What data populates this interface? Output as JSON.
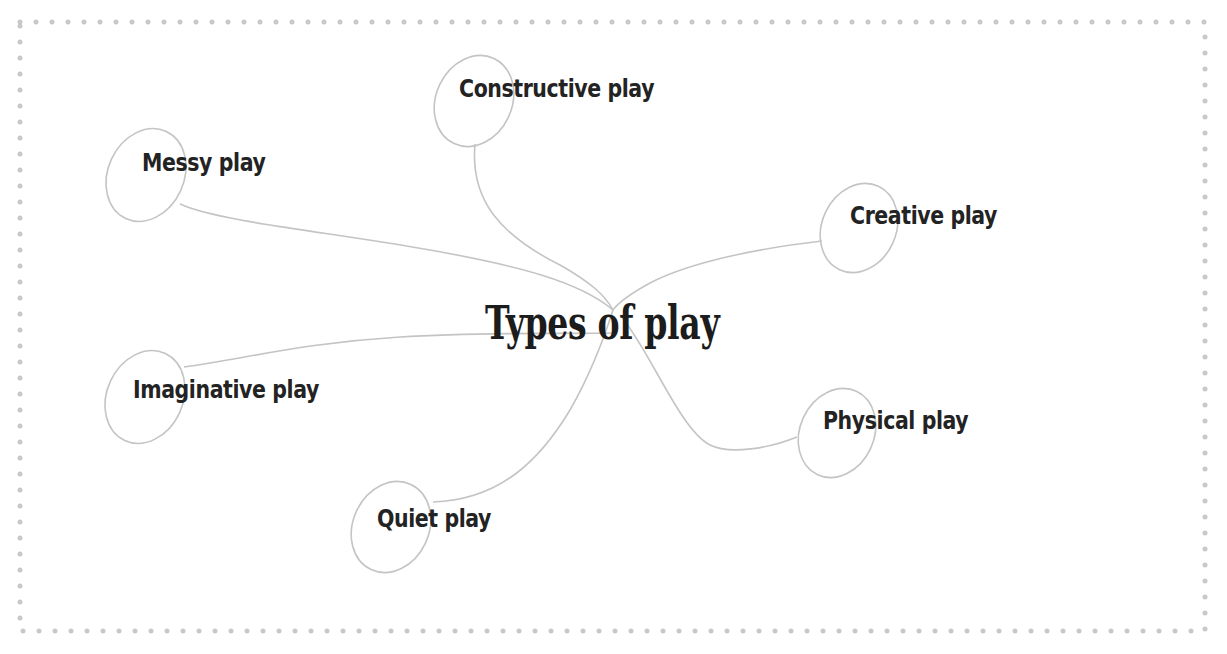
{
  "diagram": {
    "type": "mind-map",
    "title": "Types of play",
    "center": {
      "x": 613,
      "y": 310
    },
    "colors": {
      "border_dots": "#c8c8c8",
      "connector": "#c4c4c4",
      "text": "#232323",
      "background": "#ffffff"
    },
    "nodes": [
      {
        "id": "constructive",
        "label": "Constructive play"
      },
      {
        "id": "messy",
        "label": "Messy play"
      },
      {
        "id": "creative",
        "label": "Creative play"
      },
      {
        "id": "imaginative",
        "label": "Imaginative play"
      },
      {
        "id": "physical",
        "label": "Physical play"
      },
      {
        "id": "quiet",
        "label": "Quiet play"
      }
    ]
  }
}
